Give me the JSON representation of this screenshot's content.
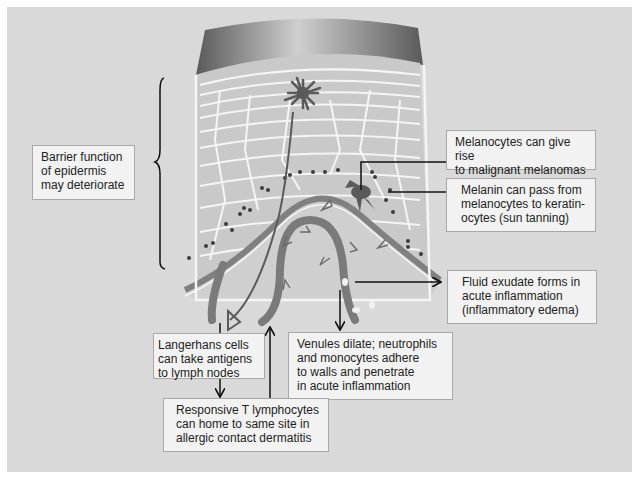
{
  "diagram": {
    "background_color": "#d9d9d9",
    "accent_color": "#6f6f6f",
    "labels": {
      "barrier": "Barrier function\nof epidermis\nmay deteriorate",
      "melanocytes": "Melanocytes can give rise\nto malignant melanomas",
      "melanin": "Melanin can pass from\nmelanocytes to keratin-\nocytes (sun tanning)",
      "fluid": "Fluid exudate forms in\nacute inflammation\n(inflammatory edema)",
      "venules": "Venules dilate; neutrophils\nand monocytes adhere\nto walls and penetrate\nin acute inflammation",
      "langerhans": "Langerhans cells\ncan take antigens\nto lymph nodes",
      "t_lymphocytes": "Responsive T lymphocytes\ncan home to same site in\nallergic contact dermatitis"
    },
    "structures": {
      "stratum_corneum": "stratum-corneum",
      "epidermis": "epidermis-cells",
      "basement_membrane": "basement-membrane",
      "langerhans_cell": "langerhans-cell",
      "melanocyte": "melanocyte",
      "venule": "venule-loop",
      "brace": "epidermis-brace"
    }
  }
}
